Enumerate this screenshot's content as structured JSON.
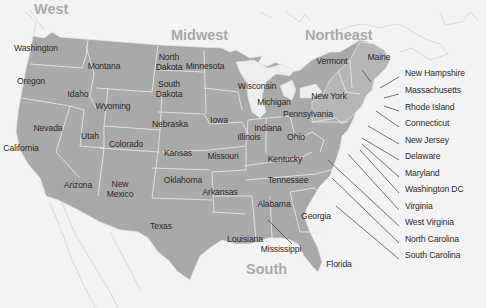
{
  "map": {
    "title": "United States regions",
    "colors": {
      "background": "#f3f3f3",
      "state_fill": "#a9a9a9",
      "northeast_fill": "#b8b8b8",
      "border": "#e6e6e6",
      "label_text": "#2a2a2a",
      "region_text": "#a9a9a9",
      "leader_line": "#3a3a3a"
    },
    "regions": [
      {
        "name": "West",
        "x": 34,
        "y": 11
      },
      {
        "name": "Midwest",
        "x": 171,
        "y": 37
      },
      {
        "name": "Northeast",
        "x": 305,
        "y": 37
      },
      {
        "name": "South",
        "x": 246,
        "y": 271
      }
    ],
    "states": [
      {
        "name": "Washington",
        "x": 36,
        "y": 49
      },
      {
        "name": "Oregon",
        "x": 31,
        "y": 82
      },
      {
        "name": "Montana",
        "x": 104,
        "y": 67
      },
      {
        "name": "Idaho",
        "x": 78,
        "y": 95
      },
      {
        "name": "North\nDakota",
        "x": 169,
        "y": 62
      },
      {
        "name": "Minnesota",
        "x": 205,
        "y": 67
      },
      {
        "name": "South\nDakota",
        "x": 169,
        "y": 89
      },
      {
        "name": "Wyoming",
        "x": 113,
        "y": 107
      },
      {
        "name": "Wisconsin",
        "x": 257,
        "y": 87
      },
      {
        "name": "Michigan",
        "x": 274,
        "y": 103
      },
      {
        "name": "New York",
        "x": 329,
        "y": 97
      },
      {
        "name": "Vermont",
        "x": 332,
        "y": 62
      },
      {
        "name": "Maine",
        "x": 379,
        "y": 58
      },
      {
        "name": "Nevada",
        "x": 48,
        "y": 129
      },
      {
        "name": "Utah",
        "x": 90,
        "y": 137
      },
      {
        "name": "Colorado",
        "x": 126,
        "y": 145
      },
      {
        "name": "Nebraska",
        "x": 170,
        "y": 125
      },
      {
        "name": "Iowa",
        "x": 219,
        "y": 121
      },
      {
        "name": "Illinois",
        "x": 249,
        "y": 138
      },
      {
        "name": "Indiana",
        "x": 268,
        "y": 129
      },
      {
        "name": "Ohio",
        "x": 296,
        "y": 138
      },
      {
        "name": "Pennsylvania",
        "x": 308,
        "y": 115
      },
      {
        "name": "California",
        "x": 21,
        "y": 149
      },
      {
        "name": "Kansas",
        "x": 178,
        "y": 154
      },
      {
        "name": "Missouri",
        "x": 223,
        "y": 157
      },
      {
        "name": "Kentucky",
        "x": 285,
        "y": 160
      },
      {
        "name": "Arizona",
        "x": 78,
        "y": 186
      },
      {
        "name": "New\nMexico",
        "x": 120,
        "y": 189
      },
      {
        "name": "Oklahoma",
        "x": 183,
        "y": 181
      },
      {
        "name": "Arkansas",
        "x": 220,
        "y": 193
      },
      {
        "name": "Tennessee",
        "x": 288,
        "y": 181
      },
      {
        "name": "Alabama",
        "x": 274,
        "y": 205
      },
      {
        "name": "Georgia",
        "x": 316,
        "y": 217
      },
      {
        "name": "Texas",
        "x": 161,
        "y": 227
      },
      {
        "name": "Louisiana",
        "x": 245,
        "y": 240
      },
      {
        "name": "Mississippi",
        "x": 281,
        "y": 250
      },
      {
        "name": "Florida",
        "x": 339,
        "y": 265
      }
    ],
    "callouts": [
      {
        "name": "New Hampshire",
        "x": 405,
        "y": 74
      },
      {
        "name": "Massachusetts",
        "x": 405,
        "y": 91
      },
      {
        "name": "Rhode Island",
        "x": 405,
        "y": 108
      },
      {
        "name": "Connecticut",
        "x": 405,
        "y": 124
      },
      {
        "name": "New Jersey",
        "x": 405,
        "y": 141
      },
      {
        "name": "Delaware",
        "x": 405,
        "y": 157
      },
      {
        "name": "Maryland",
        "x": 405,
        "y": 174
      },
      {
        "name": "Washington DC",
        "x": 405,
        "y": 190
      },
      {
        "name": "Virginia",
        "x": 405,
        "y": 207
      },
      {
        "name": "West Virginia",
        "x": 405,
        "y": 223
      },
      {
        "name": "North Carolina",
        "x": 405,
        "y": 240
      },
      {
        "name": "South Carolina",
        "x": 405,
        "y": 256
      }
    ]
  }
}
